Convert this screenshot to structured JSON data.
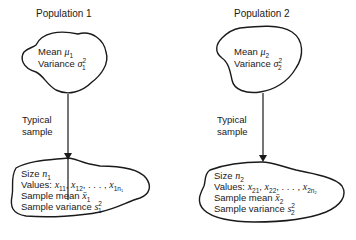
{
  "populations": [
    {
      "title": "Population 1",
      "mean_label": "Mean",
      "mean_symbol": "μ",
      "mean_sub": "1",
      "variance_label": "Variance",
      "variance_symbol": "σ",
      "variance_sub": "1",
      "variance_sup": "2",
      "arrow_label_line1": "Typical",
      "arrow_label_line2": "sample",
      "sample": {
        "size_label": "Size",
        "size_symbol": "n",
        "size_sub": "1",
        "values_label": "Values:",
        "values": [
          {
            "sym": "x",
            "sub": "11"
          },
          {
            "sym": "x",
            "sub": "12"
          },
          {
            "sym": "x",
            "sub": "1n₁"
          }
        ],
        "ellipsis": ", . . . ,",
        "mean_label": "Sample mean",
        "mean_symbol": "x̄",
        "mean_sub": "1",
        "variance_label": "Sample variance",
        "variance_symbol": "s",
        "variance_sub": "1",
        "variance_sup": "2"
      }
    },
    {
      "title": "Population 2",
      "mean_label": "Mean",
      "mean_symbol": "μ",
      "mean_sub": "2",
      "variance_label": "Variance",
      "variance_symbol": "σ",
      "variance_sub": "2",
      "variance_sup": "2",
      "arrow_label_line1": "Typical",
      "arrow_label_line2": "sample",
      "sample": {
        "size_label": "Size",
        "size_symbol": "n",
        "size_sub": "2",
        "values_label": "Values:",
        "values": [
          {
            "sym": "x",
            "sub": "21"
          },
          {
            "sym": "x",
            "sub": "22"
          },
          {
            "sym": "x",
            "sub": "2n₂"
          }
        ],
        "ellipsis": ", . . . ,",
        "mean_label": "Sample mean",
        "mean_symbol": "x̄",
        "mean_sub": "2",
        "variance_label": "Sample variance",
        "variance_symbol": "s",
        "variance_sub": "2",
        "variance_sup": "2"
      }
    }
  ],
  "colors": {
    "ink": "#1a1a1a",
    "background": "#ffffff"
  }
}
